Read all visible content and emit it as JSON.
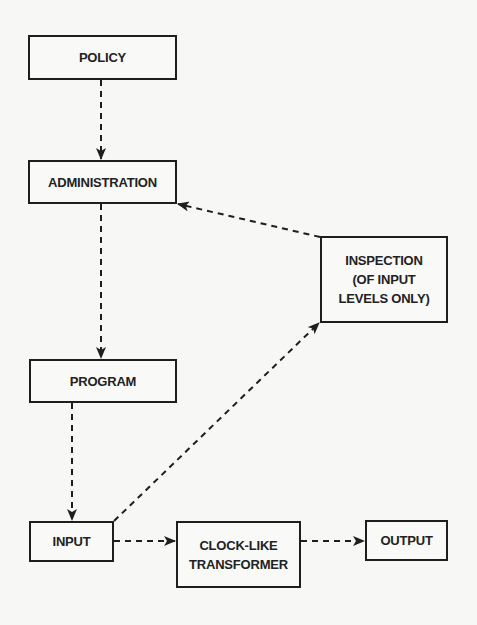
{
  "diagram": {
    "type": "flowchart",
    "colors": {
      "background": "#f7f7f5",
      "stroke": "#1e1e1e",
      "text": "#222222"
    },
    "nodes": {
      "policy": {
        "label": "POLICY"
      },
      "administration": {
        "label": "ADMINISTRATION"
      },
      "program": {
        "label": "PROGRAM"
      },
      "inspection": {
        "lines": [
          "INSPECTION",
          "(OF INPUT",
          "LEVELS ONLY)"
        ]
      },
      "input": {
        "label": "INPUT"
      },
      "transformer": {
        "lines": [
          "CLOCK-LIKE",
          "TRANSFORMER"
        ]
      },
      "output": {
        "label": "OUTPUT"
      }
    },
    "edges": [
      {
        "from": "POLICY",
        "to": "ADMINISTRATION",
        "style": "dashed-arrow"
      },
      {
        "from": "ADMINISTRATION",
        "to": "PROGRAM",
        "style": "dashed-arrow"
      },
      {
        "from": "PROGRAM",
        "to": "INPUT",
        "style": "dashed-arrow"
      },
      {
        "from": "INPUT",
        "to": "CLOCK-LIKE TRANSFORMER",
        "style": "dashed-arrow"
      },
      {
        "from": "CLOCK-LIKE TRANSFORMER",
        "to": "OUTPUT",
        "style": "dashed-arrow"
      },
      {
        "from": "INPUT",
        "to": "INSPECTION (OF INPUT LEVELS ONLY)",
        "style": "dashed-arrow"
      },
      {
        "from": "INSPECTION (OF INPUT LEVELS ONLY)",
        "to": "ADMINISTRATION",
        "style": "dashed-arrow"
      }
    ]
  }
}
